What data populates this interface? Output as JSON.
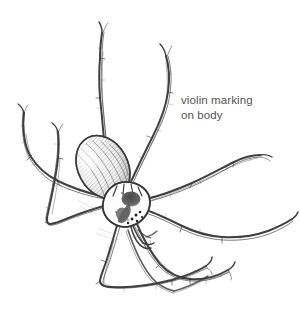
{
  "figure": {
    "kind": "ink-illustration",
    "subject_name": "brown-recluse-spider",
    "background_color": "#ffffff",
    "ink_color": "#3a3a3a",
    "shade_color": "#6d6d6d",
    "width": 300,
    "height": 310
  },
  "annotation": {
    "name": "violin-marking-callout",
    "line1": "violin marking",
    "line2": "on body",
    "text_color": "#545454",
    "font_size_px": 11.5,
    "x": 181,
    "y": 93
  },
  "anatomy": {
    "abdomen": {
      "label": "abdomen",
      "center_x": 103,
      "center_y": 167,
      "rx": 25,
      "ry": 33,
      "rotation_deg": -28,
      "shading": "dense-hatching"
    },
    "cephalothorax": {
      "label": "cephalothorax",
      "center_x": 126,
      "center_y": 203,
      "rx": 22,
      "ry": 20,
      "shading": "light-outline"
    },
    "violin_marking": {
      "label": "violin-marking",
      "center_x": 126,
      "center_y": 204,
      "fill": "#5a5a5a",
      "description": "dark fiddle-shaped blotch on cephalothorax"
    },
    "eyes": {
      "label": "eyes",
      "count": 6,
      "fill": "#2b2b2b"
    },
    "pedipalps": {
      "label": "pedipalps",
      "count": 2
    },
    "legs": {
      "label": "legs",
      "count": 8,
      "style": "long-segmented-hairy"
    }
  }
}
